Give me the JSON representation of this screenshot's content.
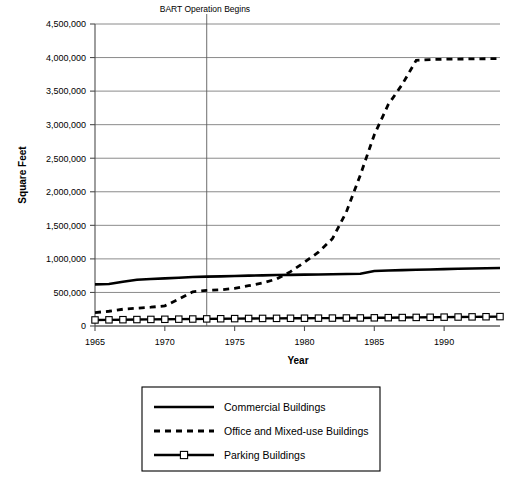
{
  "chart_data": {
    "type": "line",
    "title": "",
    "xlabel": "Year",
    "ylabel": "Square Feet",
    "xlim": [
      1965,
      1994
    ],
    "ylim": [
      0,
      4500000
    ],
    "grid": true,
    "legend_position": "bottom",
    "xticks": [
      "1965",
      "1970",
      "1975",
      "1980",
      "1985",
      "1990"
    ],
    "xtick_values": [
      1965,
      1970,
      1975,
      1980,
      1985,
      1990
    ],
    "yticks": [
      "0",
      "500,000",
      "1,000,000",
      "1,500,000",
      "2,000,000",
      "2,500,000",
      "3,000,000",
      "3,500,000",
      "4,000,000",
      "4,500,000"
    ],
    "ytick_values": [
      0,
      500000,
      1000000,
      1500000,
      2000000,
      2500000,
      3000000,
      3500000,
      4000000,
      4500000
    ],
    "annotations": [
      {
        "label": "BART Operation Begins",
        "x": 1973,
        "type": "vertical-line"
      }
    ],
    "x": [
      1965,
      1966,
      1967,
      1968,
      1969,
      1970,
      1971,
      1972,
      1973,
      1974,
      1975,
      1976,
      1977,
      1978,
      1979,
      1980,
      1981,
      1982,
      1983,
      1984,
      1985,
      1986,
      1987,
      1988,
      1989,
      1990,
      1991,
      1992,
      1993,
      1994
    ],
    "series": [
      {
        "name": "Commercial Buildings",
        "style": "solid",
        "values": [
          620000,
          625000,
          660000,
          690000,
          700000,
          710000,
          720000,
          730000,
          735000,
          740000,
          745000,
          750000,
          755000,
          760000,
          762000,
          765000,
          768000,
          772000,
          775000,
          778000,
          820000,
          828000,
          832000,
          838000,
          842000,
          848000,
          852000,
          856000,
          860000,
          865000
        ]
      },
      {
        "name": "Office and Mixed-use Buildings",
        "style": "dashed",
        "values": [
          200000,
          220000,
          250000,
          265000,
          280000,
          300000,
          400000,
          510000,
          530000,
          540000,
          560000,
          600000,
          640000,
          700000,
          810000,
          950000,
          1100000,
          1300000,
          1700000,
          2250000,
          2850000,
          3300000,
          3600000,
          3960000,
          3970000,
          3975000,
          3978000,
          3980000,
          3982000,
          3985000
        ]
      },
      {
        "name": "Parking Buildings",
        "style": "solid-markers",
        "marker": "square",
        "values": [
          90000,
          92000,
          94000,
          96000,
          98000,
          100000,
          102000,
          104000,
          106000,
          108000,
          110000,
          112000,
          113000,
          114000,
          115000,
          116000,
          117000,
          118000,
          119000,
          120000,
          122000,
          124000,
          126000,
          128000,
          130000,
          132000,
          134000,
          136000,
          138000,
          140000
        ]
      }
    ]
  },
  "legend": {
    "items": [
      {
        "label": "Commercial Buildings",
        "style": "solid"
      },
      {
        "label": "Office and Mixed-use Buildings",
        "style": "dashed"
      },
      {
        "label": "Parking Buildings",
        "style": "solid-markers"
      }
    ]
  },
  "colors": {
    "ink": "#000000",
    "grid": "#6d6d6d",
    "background": "#ffffff"
  }
}
